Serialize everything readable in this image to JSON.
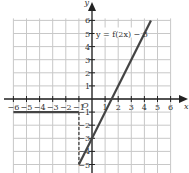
{
  "chart_data": {
    "type": "line",
    "title": "",
    "xlabel": "x",
    "ylabel": "y",
    "origin_label": "O",
    "xlim": [
      -6,
      6
    ],
    "ylim": [
      -5,
      6
    ],
    "x_ticks": [
      -6,
      -5,
      -4,
      -3,
      -2,
      -1,
      1,
      2,
      3,
      4,
      5,
      6
    ],
    "y_ticks": [
      6,
      5,
      4,
      3,
      2,
      1,
      -1,
      -2,
      -3,
      -4,
      -5
    ],
    "grid": true,
    "annotation": "y = f(2x) − 3",
    "series": [
      {
        "name": "horizontal segment",
        "points": [
          [
            -6,
            -1
          ],
          [
            -1,
            -1
          ]
        ],
        "style": "solid"
      },
      {
        "name": "vertical dashed",
        "points": [
          [
            -1,
            -1
          ],
          [
            -1,
            -5
          ]
        ],
        "style": "dashed"
      },
      {
        "name": "y = f(2x) − 3 line",
        "points": [
          [
            -1,
            -5
          ],
          [
            4.5,
            6
          ]
        ],
        "style": "solid"
      }
    ]
  },
  "labels": {
    "annotation": "y = f(2x) − 3",
    "x_axis": "x",
    "y_axis": "y",
    "origin": "O"
  }
}
